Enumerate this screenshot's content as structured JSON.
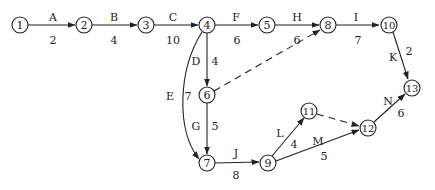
{
  "diagram": {
    "type": "activity-on-arrow network",
    "nodes": [
      {
        "id": "1",
        "x": 20,
        "y": 25
      },
      {
        "id": "2",
        "x": 84,
        "y": 25
      },
      {
        "id": "3",
        "x": 146,
        "y": 25
      },
      {
        "id": "4",
        "x": 207,
        "y": 25
      },
      {
        "id": "5",
        "x": 267,
        "y": 25
      },
      {
        "id": "8",
        "x": 328,
        "y": 25
      },
      {
        "id": "10",
        "x": 389,
        "y": 25
      },
      {
        "id": "6",
        "x": 207,
        "y": 95
      },
      {
        "id": "7",
        "x": 207,
        "y": 163
      },
      {
        "id": "9",
        "x": 268,
        "y": 163
      },
      {
        "id": "11",
        "x": 309,
        "y": 111
      },
      {
        "id": "12",
        "x": 368,
        "y": 128
      },
      {
        "id": "13",
        "x": 412,
        "y": 88
      }
    ],
    "activities": [
      {
        "name": "A",
        "from": "1",
        "to": "2",
        "duration": "2"
      },
      {
        "name": "B",
        "from": "2",
        "to": "3",
        "duration": "4"
      },
      {
        "name": "C",
        "from": "3",
        "to": "4",
        "duration": "10"
      },
      {
        "name": "F",
        "from": "4",
        "to": "5",
        "duration": "6"
      },
      {
        "name": "H",
        "from": "5",
        "to": "8",
        "duration": "6"
      },
      {
        "name": "I",
        "from": "8",
        "to": "10",
        "duration": "7"
      },
      {
        "name": "D",
        "from": "4",
        "to": "6",
        "duration": "4"
      },
      {
        "name": "E",
        "from": "4",
        "to": "7",
        "duration": "7"
      },
      {
        "name": "G",
        "from": "6",
        "to": "7",
        "duration": "5"
      },
      {
        "name": "J",
        "from": "7",
        "to": "9",
        "duration": "8"
      },
      {
        "name": "K",
        "from": "10",
        "to": "13",
        "duration": "2"
      },
      {
        "name": "L",
        "from": "9",
        "to": "11",
        "duration": "4"
      },
      {
        "name": "M",
        "from": "9",
        "to": "12",
        "duration": "5"
      },
      {
        "name": "N",
        "from": "12",
        "to": "13",
        "duration": "6"
      }
    ],
    "dummies": [
      {
        "from": "6",
        "to": "8"
      },
      {
        "from": "11",
        "to": "12"
      }
    ]
  },
  "labels": {
    "A": "A",
    "A_d": "2",
    "B": "B",
    "B_d": "4",
    "C": "C",
    "C_d": "10",
    "F": "F",
    "F_d": "6",
    "H": "H",
    "H_d": "6",
    "I": "I",
    "I_d": "7",
    "D": "D",
    "D_d": "4",
    "E": "E",
    "E_d": "7",
    "G": "G",
    "G_d": "5",
    "J": "J",
    "J_d": "8",
    "K": "K",
    "K_d": "2",
    "L": "L",
    "L_d": "4",
    "M": "M",
    "M_d": "5",
    "N": "N",
    "N_d": "6"
  },
  "node_labels": {
    "n1": "1",
    "n2": "2",
    "n3": "3",
    "n4": "4",
    "n5": "5",
    "n6": "6",
    "n7": "7",
    "n8": "8",
    "n9": "9",
    "n10": "10",
    "n11": "11",
    "n12": "12",
    "n13": "13"
  }
}
